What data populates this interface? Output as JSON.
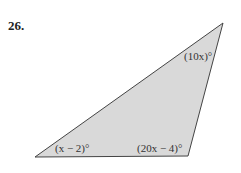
{
  "problem_number": "26.",
  "triangle": {
    "vertices": {
      "top_right": [
        223,
        23
      ],
      "bottom_left": [
        35,
        157
      ],
      "bottom_right": [
        188,
        156
      ]
    },
    "fill": "#d9d9d9",
    "stroke": "#444444"
  },
  "angles": {
    "top": "(10x)°",
    "bottom_left": "(x − 2)°",
    "bottom_right": "(20x − 4)°"
  }
}
